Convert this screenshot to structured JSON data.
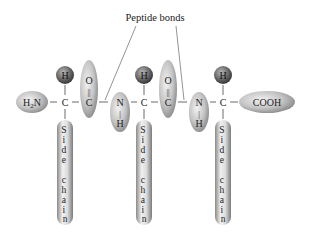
{
  "title": "Peptide bonds",
  "colors": {
    "background": "#ffffff",
    "capsule_light": "#e4e4e4",
    "capsule_dark": "#8a8a8a",
    "atom_light": "#9a9a9a",
    "atom_dark": "#3f3f3f",
    "line": "#555555",
    "text": "#222222"
  },
  "termini": {
    "n_terminus": {
      "label": "H2N",
      "main": "H",
      "sub": "2",
      "rest": "N"
    },
    "c_terminus": {
      "label": "COOH"
    }
  },
  "residues": [
    {
      "alpha_h": "H",
      "alpha_c": "C",
      "side_chain": [
        "S",
        "i",
        "d",
        "e",
        "",
        "c",
        "h",
        "a",
        "i",
        "n"
      ]
    },
    {
      "alpha_h": "H",
      "alpha_c": "C",
      "side_chain": [
        "S",
        "i",
        "d",
        "e",
        "",
        "c",
        "h",
        "a",
        "i",
        "n"
      ]
    },
    {
      "alpha_h": "H",
      "alpha_c": "C",
      "side_chain": [
        "S",
        "i",
        "d",
        "e",
        "",
        "c",
        "h",
        "a",
        "i",
        "n"
      ]
    }
  ],
  "carbonyls": [
    {
      "o": "O",
      "bond": "||",
      "c": "C"
    },
    {
      "o": "O",
      "bond": "||",
      "c": "C"
    }
  ],
  "amides": [
    {
      "n": "N",
      "bond": "|",
      "h": "H"
    },
    {
      "n": "N",
      "bond": "|",
      "h": "H"
    }
  ],
  "labels": {
    "peptide_bonds": "Peptide bonds"
  }
}
